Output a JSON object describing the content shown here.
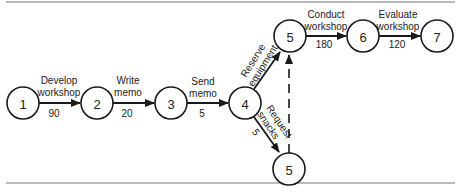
{
  "diagram": {
    "type": "activity-on-arrow network",
    "nodes": [
      {
        "id": "n1",
        "label": "1"
      },
      {
        "id": "n2",
        "label": "2"
      },
      {
        "id": "n3",
        "label": "3"
      },
      {
        "id": "n4",
        "label": "4"
      },
      {
        "id": "n5a",
        "label": "5"
      },
      {
        "id": "n6",
        "label": "6"
      },
      {
        "id": "n7",
        "label": "7"
      },
      {
        "id": "n5b",
        "label": "5"
      }
    ],
    "edges": [
      {
        "from": "1",
        "to": "2",
        "label_line1": "Develop",
        "label_line2": "workshop",
        "duration": "90"
      },
      {
        "from": "2",
        "to": "3",
        "label_line1": "Write",
        "label_line2": "memo",
        "duration": "20"
      },
      {
        "from": "3",
        "to": "4",
        "label_line1": "Send",
        "label_line2": "memo",
        "duration": "5"
      },
      {
        "from": "4",
        "to": "5",
        "label_line1": "Reserve",
        "label_line2": "equipment",
        "duration": ""
      },
      {
        "from": "4",
        "to": "5",
        "label_line1": "Request",
        "label_line2": "snacks",
        "duration": "5"
      },
      {
        "from": "5",
        "to": "6",
        "label_line1": "Conduct",
        "label_line2": "workshop",
        "duration": "180"
      },
      {
        "from": "6",
        "to": "7",
        "label_line1": "Evaluate",
        "label_line2": "workshop",
        "duration": "120"
      },
      {
        "from": "5 (bottom)",
        "to": "5 (top)",
        "label_line1": "",
        "label_line2": "",
        "duration": "",
        "style": "dashed"
      }
    ]
  }
}
